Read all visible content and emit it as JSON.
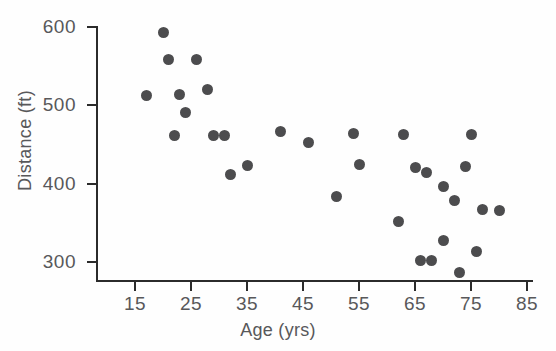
{
  "chart_data": {
    "type": "scatter",
    "title": "",
    "xlabel": "Age (yrs)",
    "ylabel": "Distance (ft)",
    "xlim": [
      10,
      87
    ],
    "ylim": [
      270,
      615
    ],
    "xticks": [
      15,
      25,
      35,
      45,
      55,
      65,
      75,
      85
    ],
    "xtick_labels": [
      "15",
      "25",
      "35",
      "45",
      "55",
      "65",
      "75",
      "85"
    ],
    "yticks": [
      300,
      400,
      500,
      600
    ],
    "ytick_labels": [
      "300",
      "400",
      "500",
      "600"
    ],
    "grid": false,
    "legend": null,
    "marker": {
      "shape": "circle",
      "color": "#4c4c4e",
      "size_px": 11
    },
    "axis_color": "#2b2b2b",
    "text_color": "#58585a",
    "background": "#fefefe",
    "n_points": 31,
    "points": [
      {
        "x": 20,
        "y": 593
      },
      {
        "x": 21,
        "y": 559
      },
      {
        "x": 26,
        "y": 559
      },
      {
        "x": 17,
        "y": 513
      },
      {
        "x": 23,
        "y": 514
      },
      {
        "x": 28,
        "y": 520
      },
      {
        "x": 24,
        "y": 491
      },
      {
        "x": 22,
        "y": 462
      },
      {
        "x": 29,
        "y": 462
      },
      {
        "x": 31,
        "y": 461
      },
      {
        "x": 32,
        "y": 412
      },
      {
        "x": 35,
        "y": 423
      },
      {
        "x": 41,
        "y": 466
      },
      {
        "x": 46,
        "y": 453
      },
      {
        "x": 51,
        "y": 384
      },
      {
        "x": 54,
        "y": 464
      },
      {
        "x": 55,
        "y": 425
      },
      {
        "x": 62,
        "y": 352
      },
      {
        "x": 63,
        "y": 463
      },
      {
        "x": 65,
        "y": 421
      },
      {
        "x": 66,
        "y": 302
      },
      {
        "x": 67,
        "y": 414
      },
      {
        "x": 68,
        "y": 302
      },
      {
        "x": 70,
        "y": 396
      },
      {
        "x": 70,
        "y": 327
      },
      {
        "x": 72,
        "y": 379
      },
      {
        "x": 73,
        "y": 286
      },
      {
        "x": 74,
        "y": 422
      },
      {
        "x": 75,
        "y": 463
      },
      {
        "x": 76,
        "y": 314
      },
      {
        "x": 77,
        "y": 367
      },
      {
        "x": 80,
        "y": 366
      }
    ]
  }
}
